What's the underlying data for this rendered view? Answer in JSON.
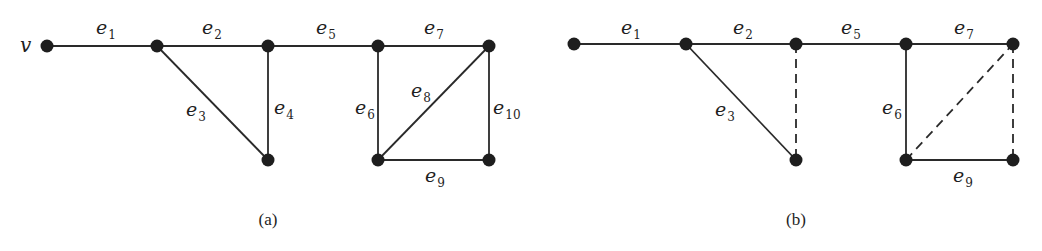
{
  "panels": [
    {
      "id": "a",
      "caption": "(a)",
      "caption_pos": [
        268,
        225
      ],
      "vertex_label": {
        "text": "v",
        "x": 20,
        "y": 52
      },
      "nodes": [
        {
          "id": "v",
          "x": 47,
          "y": 46
        },
        {
          "id": "n2",
          "x": 157,
          "y": 46
        },
        {
          "id": "n3",
          "x": 268,
          "y": 46
        },
        {
          "id": "n4",
          "x": 268,
          "y": 160
        },
        {
          "id": "n5",
          "x": 378,
          "y": 46
        },
        {
          "id": "n6",
          "x": 489,
          "y": 46
        },
        {
          "id": "n7",
          "x": 378,
          "y": 160
        },
        {
          "id": "n8",
          "x": 489,
          "y": 160
        }
      ],
      "edges": [
        {
          "label": "e",
          "sub": "1",
          "from": "v",
          "to": "n2",
          "style": "solid",
          "lx": 96,
          "ly": 34
        },
        {
          "label": "e",
          "sub": "2",
          "from": "n2",
          "to": "n3",
          "style": "solid",
          "lx": 202,
          "ly": 34
        },
        {
          "label": "e",
          "sub": "3",
          "from": "n2",
          "to": "n4",
          "style": "solid",
          "lx": 186,
          "ly": 116
        },
        {
          "label": "e",
          "sub": "4",
          "from": "n3",
          "to": "n4",
          "style": "solid",
          "lx": 274,
          "ly": 114
        },
        {
          "label": "e",
          "sub": "5",
          "from": "n3",
          "to": "n5",
          "style": "solid",
          "lx": 316,
          "ly": 34
        },
        {
          "label": "e",
          "sub": "6",
          "from": "n5",
          "to": "n7",
          "style": "solid",
          "lx": 355,
          "ly": 114
        },
        {
          "label": "e",
          "sub": "7",
          "from": "n5",
          "to": "n6",
          "style": "solid",
          "lx": 424,
          "ly": 34
        },
        {
          "label": "e",
          "sub": "8",
          "from": "n7",
          "to": "n6",
          "style": "solid",
          "lx": 411,
          "ly": 97
        },
        {
          "label": "e",
          "sub": "9",
          "from": "n7",
          "to": "n8",
          "style": "solid",
          "lx": 425,
          "ly": 182
        },
        {
          "label": "e",
          "sub": "10",
          "from": "n6",
          "to": "n8",
          "style": "solid",
          "lx": 493,
          "ly": 114
        }
      ]
    },
    {
      "id": "b",
      "caption": "(b)",
      "caption_pos": [
        796,
        225
      ],
      "vertex_label": null,
      "nodes": [
        {
          "id": "b1",
          "x": 574,
          "y": 44
        },
        {
          "id": "b2",
          "x": 686,
          "y": 44
        },
        {
          "id": "b3",
          "x": 796,
          "y": 44
        },
        {
          "id": "b4",
          "x": 796,
          "y": 160
        },
        {
          "id": "b5",
          "x": 906,
          "y": 44
        },
        {
          "id": "b6",
          "x": 1013,
          "y": 44
        },
        {
          "id": "b7",
          "x": 906,
          "y": 160
        },
        {
          "id": "b8",
          "x": 1013,
          "y": 160
        }
      ],
      "edges": [
        {
          "label": "e",
          "sub": "1",
          "from": "b1",
          "to": "b2",
          "style": "solid",
          "lx": 621,
          "ly": 34
        },
        {
          "label": "e",
          "sub": "2",
          "from": "b2",
          "to": "b3",
          "style": "solid",
          "lx": 733,
          "ly": 34
        },
        {
          "label": "e",
          "sub": "3",
          "from": "b2",
          "to": "b4",
          "style": "solid",
          "lx": 715,
          "ly": 116
        },
        {
          "label": "",
          "sub": "",
          "from": "b3",
          "to": "b4",
          "style": "dashed",
          "lx": 0,
          "ly": 0
        },
        {
          "label": "e",
          "sub": "5",
          "from": "b3",
          "to": "b5",
          "style": "solid",
          "lx": 841,
          "ly": 34
        },
        {
          "label": "e",
          "sub": "6",
          "from": "b5",
          "to": "b7",
          "style": "solid",
          "lx": 882,
          "ly": 114
        },
        {
          "label": "e",
          "sub": "7",
          "from": "b5",
          "to": "b6",
          "style": "solid",
          "lx": 954,
          "ly": 34
        },
        {
          "label": "",
          "sub": "",
          "from": "b7",
          "to": "b6",
          "style": "dashed",
          "lx": 0,
          "ly": 0
        },
        {
          "label": "e",
          "sub": "9",
          "from": "b7",
          "to": "b8",
          "style": "solid",
          "lx": 953,
          "ly": 182
        },
        {
          "label": "",
          "sub": "",
          "from": "b6",
          "to": "b8",
          "style": "dashed",
          "lx": 0,
          "ly": 0
        }
      ]
    }
  ]
}
